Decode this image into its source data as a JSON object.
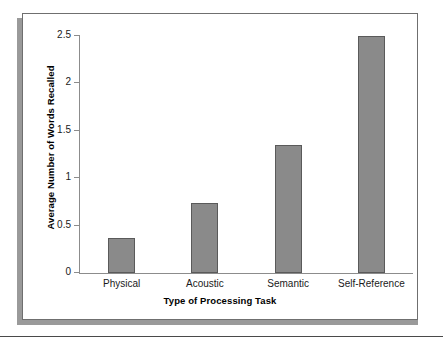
{
  "figure": {
    "background_color": "#ffffff",
    "frame_border_color": "#6f6f6f",
    "shadow_color": "#9a9a9a",
    "rule_color": "#4a4a4a"
  },
  "chart_data": {
    "type": "bar",
    "title": "",
    "subtitle": "",
    "xlabel": "Type of Processing Task",
    "ylabel": "Average Number of Words Recalled",
    "categories": [
      "Physical",
      "Acoustic",
      "Semantic",
      "Self-Reference"
    ],
    "values": [
      0.37,
      0.74,
      1.35,
      2.5
    ],
    "ylim": [
      0,
      2.5
    ],
    "yticks": [
      0,
      0.5,
      1,
      1.5,
      2,
      2.5
    ],
    "ytick_labels": [
      "0",
      "0.5",
      "1",
      "1.5",
      "2",
      "2.5"
    ],
    "grid": false,
    "legend": false,
    "legend_position": "none",
    "bar_color": "#8a8a8a",
    "bar_border_color": "#5a5a5a",
    "axis_color": "#8c8c8c",
    "annotations": []
  }
}
